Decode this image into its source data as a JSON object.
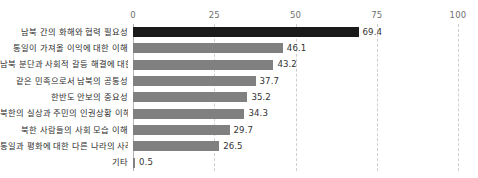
{
  "chart_data": {
    "type": "bar",
    "orientation": "horizontal",
    "title": "",
    "subtitle": "",
    "xlabel": "",
    "ylabel": "",
    "xlim": [
      0,
      100
    ],
    "xticks": [
      "0",
      "25",
      "50",
      "75",
      "100"
    ],
    "xtick_values": [
      0,
      25,
      50,
      75,
      100
    ],
    "grid": "vertical dashed gridlines at 25, 50, 75, 100; solid axis line at 0",
    "legend": "none",
    "categories": [
      "남북 간의 화해와 협력 필요성",
      "통일이 가져올 이익에 대한 이해",
      "남북 분단과 사회적 갈등 해결에 대한 이해",
      "같은 민족으로서 남북의 공통성",
      "한반도 안보의 중요성",
      "북한의 실상과 주민의 인권상황 이해",
      "북한 사람들의 사회 모습 이해",
      "통일과 평화에 대한 다른 나라의 사례",
      "기타"
    ],
    "values": [
      69.4,
      46.1,
      43.2,
      37.7,
      35.2,
      34.3,
      29.7,
      26.5,
      0.5
    ],
    "value_labels": [
      "69.4",
      "46.1",
      "43.2",
      "37.7",
      "35.2",
      "34.3",
      "29.7",
      "26.5",
      "0.5"
    ],
    "bar_colors": [
      "#1a1a1a",
      "#808080",
      "#808080",
      "#808080",
      "#808080",
      "#808080",
      "#808080",
      "#808080",
      "#808080"
    ],
    "highlight_index": 0,
    "colors": {
      "highlight_bar": "#1a1a1a",
      "default_bar": "#808080",
      "gridline": "#cfcfcf",
      "axis_line": "#b4b4b4",
      "tick_text": "#6f6f6f",
      "category_text": "#2b2b2b",
      "value_text": "#333333",
      "background": "#ffffff"
    }
  }
}
